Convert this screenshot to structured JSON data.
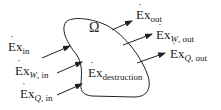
{
  "diagram": {
    "region_symbol": "Ω",
    "inputs": [
      {
        "symbol": "Ex",
        "sub_var": "",
        "sub_rest": "in"
      },
      {
        "symbol": "Ex",
        "sub_var": "W",
        "sub_rest": ", in"
      },
      {
        "symbol": "Ex",
        "sub_var": "Q",
        "sub_rest": ", in"
      }
    ],
    "outputs": [
      {
        "symbol": "Ex",
        "sub_var": "",
        "sub_rest": "out"
      },
      {
        "symbol": "Ex",
        "sub_var": "W",
        "sub_rest": ", out"
      },
      {
        "symbol": "Ex",
        "sub_var": "Q",
        "sub_rest": ", out"
      }
    ],
    "internal": {
      "symbol": "Ex",
      "sub_var": "",
      "sub_rest": "destruction"
    },
    "dot_glyph": "˙",
    "colors": {
      "stroke": "#222222",
      "text": "#222222"
    }
  }
}
